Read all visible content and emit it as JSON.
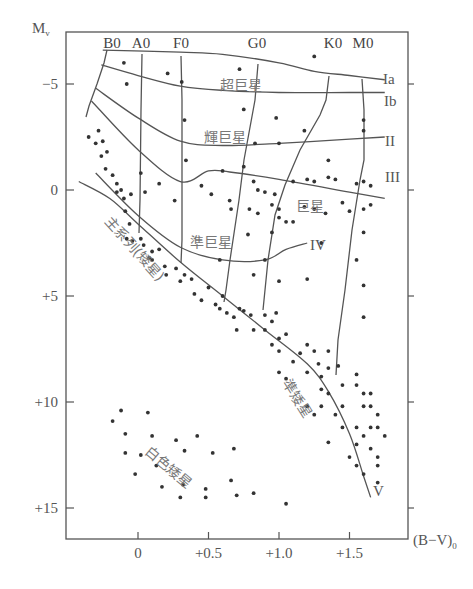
{
  "chart_data": {
    "type": "scatter",
    "xlabel": "(B−V)₀",
    "ylabel": "Mᵥ",
    "xlim": [
      -0.52,
      1.95
    ],
    "ylim": [
      -7,
      17
    ],
    "y_inverted": true,
    "grid": false,
    "x_ticks": [
      {
        "v": 0,
        "label": "0"
      },
      {
        "v": 0.5,
        "label": "+0.5"
      },
      {
        "v": 1.0,
        "label": "+1.0"
      },
      {
        "v": 1.5,
        "label": "+1.5"
      }
    ],
    "y_ticks": [
      {
        "v": -5,
        "label": "−5"
      },
      {
        "v": 0,
        "label": "0"
      },
      {
        "v": 5,
        "label": "+5"
      },
      {
        "v": 10,
        "label": "+10"
      },
      {
        "v": 15,
        "label": "+15"
      }
    ],
    "spectral_types": [
      {
        "label": "B0",
        "x": -0.28
      },
      {
        "label": "A0",
        "x": 0.0
      },
      {
        "label": "F0",
        "x": 0.31
      },
      {
        "label": "G0",
        "x": 0.6
      },
      {
        "label": "K0",
        "x": 1.25
      },
      {
        "label": "M0",
        "x": 1.5
      }
    ],
    "luminosity_classes": [
      {
        "label": "Ia",
        "line": [
          [
            -0.25,
            -6.6
          ],
          [
            0.3,
            -6.5
          ],
          [
            0.6,
            -6.4
          ],
          [
            1.0,
            -6.0
          ],
          [
            1.25,
            -5.6
          ],
          [
            1.5,
            -5.4
          ],
          [
            1.75,
            -5.2
          ]
        ]
      },
      {
        "label": "Ib",
        "line": [
          [
            -0.26,
            -5.9
          ],
          [
            0.0,
            -5.4
          ],
          [
            0.3,
            -4.9
          ],
          [
            0.6,
            -4.7
          ],
          [
            1.0,
            -4.6
          ],
          [
            1.5,
            -4.6
          ],
          [
            1.75,
            -4.6
          ]
        ]
      },
      {
        "label": "II",
        "line": [
          [
            -0.3,
            -4.8
          ],
          [
            0.0,
            -3.4
          ],
          [
            0.3,
            -2.3
          ],
          [
            0.6,
            -2.1
          ],
          [
            1.0,
            -2.2
          ],
          [
            1.5,
            -2.4
          ],
          [
            1.75,
            -2.5
          ]
        ]
      },
      {
        "label": "III",
        "line": [
          [
            -0.33,
            -4.2
          ],
          [
            0.0,
            -1.9
          ],
          [
            0.3,
            -0.4
          ],
          [
            0.5,
            -0.9
          ],
          [
            0.65,
            -0.85
          ],
          [
            1.0,
            -0.5
          ],
          [
            1.5,
            0.1
          ],
          [
            1.75,
            0.4
          ]
        ]
      },
      {
        "label": "IV",
        "line": [
          [
            -0.3,
            -0.8
          ],
          [
            0.0,
            1.2
          ],
          [
            0.3,
            2.7
          ],
          [
            0.6,
            3.3
          ],
          [
            0.9,
            3.3
          ],
          [
            1.05,
            2.8
          ],
          [
            1.2,
            2.5
          ]
        ]
      },
      {
        "label": "V",
        "line": [
          [
            -0.42,
            -0.4
          ],
          [
            -0.2,
            0.4
          ],
          [
            0.0,
            1.6
          ],
          [
            0.3,
            3.4
          ],
          [
            0.6,
            5.0
          ],
          [
            0.9,
            6.6
          ],
          [
            1.2,
            8.2
          ],
          [
            1.35,
            9.5
          ],
          [
            1.5,
            11.5
          ],
          [
            1.6,
            13.5
          ],
          [
            1.65,
            14.5
          ]
        ]
      }
    ],
    "region_labels": [
      {
        "label": "超巨星",
        "meaning": "supergiants",
        "x": 0.78,
        "y": -5.2
      },
      {
        "label": "輝巨星",
        "meaning": "bright giants",
        "x": 0.62,
        "y": -2.5
      },
      {
        "label": "巨星",
        "meaning": "giants",
        "x": 1.12,
        "y": 0.7
      },
      {
        "label": "準巨星",
        "meaning": "subgiants",
        "x": 0.55,
        "y": 2.4
      },
      {
        "label": "主系列(矮星)",
        "meaning": "main sequence (dwarfs)",
        "x": -0.1,
        "y": 3.5,
        "angle": 42
      },
      {
        "label": "準矮星",
        "meaning": "subdwarfs",
        "x": 1.15,
        "y": 11.0,
        "angle": 55
      },
      {
        "label": "白色矮星",
        "meaning": "white dwarfs",
        "x": 0.2,
        "y": 12.5,
        "angle": 38
      }
    ],
    "points": [
      [
        -0.1,
        -6.0
      ],
      [
        0.21,
        -5.5
      ],
      [
        0.31,
        -5.1
      ],
      [
        0.72,
        -5.7
      ],
      [
        1.25,
        -6.3
      ],
      [
        -0.08,
        -5.0
      ],
      [
        0.33,
        -3.3
      ],
      [
        0.75,
        -3.8
      ],
      [
        0.98,
        -3.4
      ],
      [
        1.18,
        -2.8
      ],
      [
        1.6,
        -3.3
      ],
      [
        1.6,
        -2.8
      ],
      [
        0.83,
        -2.2
      ],
      [
        1.0,
        -2.2
      ],
      [
        0.75,
        -1.1
      ],
      [
        1.35,
        -1.4
      ],
      [
        -0.35,
        -2.5
      ],
      [
        -0.25,
        -2.3
      ],
      [
        -0.28,
        -2.8
      ],
      [
        -0.3,
        -2.2
      ],
      [
        -0.22,
        -1.8
      ],
      [
        -0.26,
        -1.6
      ],
      [
        -0.23,
        -1.0
      ],
      [
        -0.18,
        -0.7
      ],
      [
        -0.15,
        -0.3
      ],
      [
        -0.12,
        0.0
      ],
      [
        -0.15,
        0.1
      ],
      [
        -0.1,
        0.4
      ],
      [
        -0.05,
        0.2
      ],
      [
        -0.09,
        1.0
      ],
      [
        0.02,
        -0.8
      ],
      [
        0.05,
        0.1
      ],
      [
        0.15,
        -0.3
      ],
      [
        0.26,
        0.5
      ],
      [
        0.34,
        -1.4
      ],
      [
        0.45,
        -0.2
      ],
      [
        0.6,
        -0.9
      ],
      [
        0.65,
        0.5
      ],
      [
        0.82,
        -0.4
      ],
      [
        0.85,
        0.0
      ],
      [
        0.9,
        0.1
      ],
      [
        0.97,
        0.2
      ],
      [
        1.1,
        -0.4
      ],
      [
        1.2,
        -0.5
      ],
      [
        1.25,
        -0.4
      ],
      [
        1.35,
        -0.6
      ],
      [
        1.4,
        -0.5
      ],
      [
        1.6,
        -0.4
      ],
      [
        1.55,
        -0.3
      ],
      [
        1.65,
        -0.2
      ],
      [
        0.95,
        0.7
      ],
      [
        1.0,
        0.9
      ],
      [
        1.18,
        0.8
      ],
      [
        1.25,
        0.9
      ],
      [
        1.33,
        1.1
      ],
      [
        1.45,
        0.6
      ],
      [
        1.5,
        1.0
      ],
      [
        1.6,
        0.9
      ],
      [
        1.65,
        0.7
      ],
      [
        0.52,
        0.2
      ],
      [
        0.66,
        0.9
      ],
      [
        0.79,
        0.9
      ],
      [
        0.85,
        1.1
      ],
      [
        1.0,
        1.3
      ],
      [
        1.05,
        1.5
      ],
      [
        1.1,
        1.5
      ],
      [
        0.78,
        2.1
      ],
      [
        0.95,
        2.0
      ],
      [
        1.3,
        2.5
      ],
      [
        1.6,
        2.0
      ],
      [
        -0.06,
        1.6
      ],
      [
        -0.08,
        2.3
      ],
      [
        -0.04,
        2.4
      ],
      [
        0.02,
        2.3
      ],
      [
        0.04,
        2.6
      ],
      [
        0.08,
        3.2
      ],
      [
        0.1,
        2.9
      ],
      [
        0.15,
        2.8
      ],
      [
        0.1,
        3.3
      ],
      [
        0.19,
        3.6
      ],
      [
        0.2,
        4.0
      ],
      [
        0.27,
        3.7
      ],
      [
        0.3,
        4.3
      ],
      [
        0.33,
        4.0
      ],
      [
        0.38,
        4.2
      ],
      [
        0.4,
        4.9
      ],
      [
        0.45,
        5.2
      ],
      [
        0.55,
        5.4
      ],
      [
        0.58,
        5.6
      ],
      [
        0.6,
        5.0
      ],
      [
        0.63,
        5.8
      ],
      [
        0.68,
        6.0
      ],
      [
        0.72,
        5.6
      ],
      [
        0.75,
        5.7
      ],
      [
        0.82,
        4.0
      ],
      [
        0.9,
        3.3
      ],
      [
        1.0,
        4.3
      ],
      [
        1.2,
        4.2
      ],
      [
        1.55,
        3.3
      ],
      [
        1.6,
        4.5
      ],
      [
        1.6,
        6.0
      ],
      [
        0.5,
        4.6
      ],
      [
        0.58,
        3.3
      ],
      [
        0.8,
        5.9
      ],
      [
        0.9,
        5.9
      ],
      [
        0.95,
        6.2
      ],
      [
        0.98,
        5.8
      ],
      [
        0.9,
        6.6
      ],
      [
        0.95,
        7.3
      ],
      [
        1.05,
        6.8
      ],
      [
        1.0,
        7.6
      ],
      [
        1.15,
        7.7
      ],
      [
        1.2,
        7.3
      ],
      [
        1.25,
        7.6
      ],
      [
        1.28,
        8.2
      ],
      [
        1.35,
        7.6
      ],
      [
        1.35,
        8.4
      ],
      [
        1.3,
        8.8
      ],
      [
        1.2,
        8.6
      ],
      [
        1.1,
        8.1
      ],
      [
        1.05,
        8.9
      ],
      [
        1.0,
        8.6
      ],
      [
        1.0,
        7.0
      ],
      [
        0.82,
        6.6
      ],
      [
        0.7,
        6.6
      ],
      [
        1.42,
        8.3
      ],
      [
        1.55,
        8.7
      ],
      [
        1.3,
        9.4
      ],
      [
        1.35,
        9.6
      ],
      [
        1.45,
        9.2
      ],
      [
        1.55,
        9.2
      ],
      [
        1.6,
        9.6
      ],
      [
        1.65,
        9.6
      ],
      [
        1.2,
        10.2
      ],
      [
        1.3,
        10.2
      ],
      [
        1.45,
        10.2
      ],
      [
        1.6,
        10.2
      ],
      [
        1.65,
        10.2
      ],
      [
        1.7,
        10.6
      ],
      [
        1.25,
        10.6
      ],
      [
        1.4,
        10.6
      ],
      [
        1.45,
        11.2
      ],
      [
        1.55,
        11.2
      ],
      [
        1.65,
        11.2
      ],
      [
        1.7,
        11.2
      ],
      [
        1.6,
        11.6
      ],
      [
        1.75,
        11.6
      ],
      [
        1.35,
        11.9
      ],
      [
        1.55,
        12.0
      ],
      [
        1.65,
        12.2
      ],
      [
        1.5,
        12.6
      ],
      [
        1.7,
        12.6
      ],
      [
        1.55,
        13.0
      ],
      [
        1.7,
        13.0
      ],
      [
        1.6,
        13.4
      ],
      [
        1.7,
        13.8
      ],
      [
        -0.18,
        10.9
      ],
      [
        -0.12,
        10.4
      ],
      [
        0.07,
        10.5
      ],
      [
        -0.09,
        11.5
      ],
      [
        0.1,
        11.6
      ],
      [
        0.27,
        11.8
      ],
      [
        0.42,
        11.6
      ],
      [
        0.33,
        12.3
      ],
      [
        -0.09,
        12.4
      ],
      [
        0.02,
        12.5
      ],
      [
        0.13,
        13.0
      ],
      [
        0.53,
        12.4
      ],
      [
        0.68,
        12.2
      ],
      [
        -0.02,
        13.4
      ],
      [
        0.17,
        14.0
      ],
      [
        0.32,
        13.9
      ],
      [
        0.48,
        14.1
      ],
      [
        0.66,
        13.7
      ],
      [
        0.3,
        14.5
      ],
      [
        0.48,
        14.5
      ],
      [
        0.7,
        14.4
      ],
      [
        0.82,
        14.3
      ],
      [
        1.05,
        14.8
      ]
    ]
  },
  "labels": {
    "y_axis": "M",
    "y_axis_sub": "v",
    "x_axis": "(B−V)",
    "x_axis_sub": "0",
    "cls_Ia": "Ia",
    "cls_Ib": "Ib",
    "cls_II": "II",
    "cls_III": "III",
    "cls_IV": "IV",
    "cls_V": "V",
    "region_supergiant": "超巨星",
    "region_bright_giant": "輝巨星",
    "region_giant": "巨星",
    "region_subgiant": "準巨星",
    "region_main_sequence": "主系列(矮星)",
    "region_subdwarf": "準矮星",
    "region_white_dwarf": "白色矮星"
  }
}
